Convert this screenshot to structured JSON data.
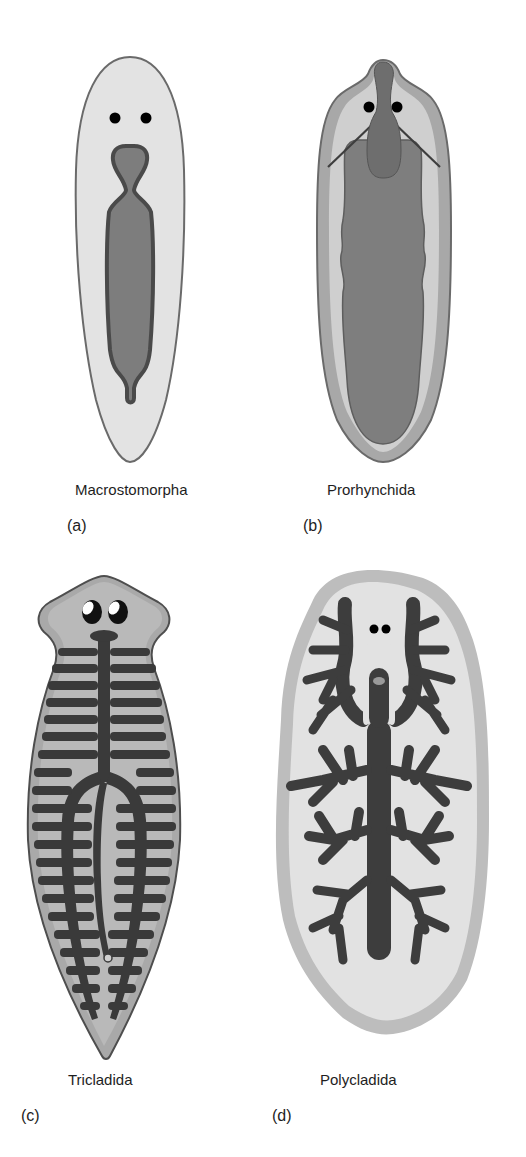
{
  "figure": {
    "panels": [
      {
        "letter": "(a)",
        "name": "Macrostomorpha"
      },
      {
        "letter": "(b)",
        "name": "Prorhynchida"
      },
      {
        "letter": "(c)",
        "name": "Tricladida"
      },
      {
        "letter": "(d)",
        "name": "Polycladida"
      }
    ],
    "colors": {
      "body_light": "#e4e4e4",
      "body_mid": "#bdbdbd",
      "body_rim": "#a6a6a6",
      "gut_mid": "#7a7a7a",
      "gut_dark": "#3a3a3a",
      "outline": "#555555",
      "eye": "#000000"
    }
  }
}
